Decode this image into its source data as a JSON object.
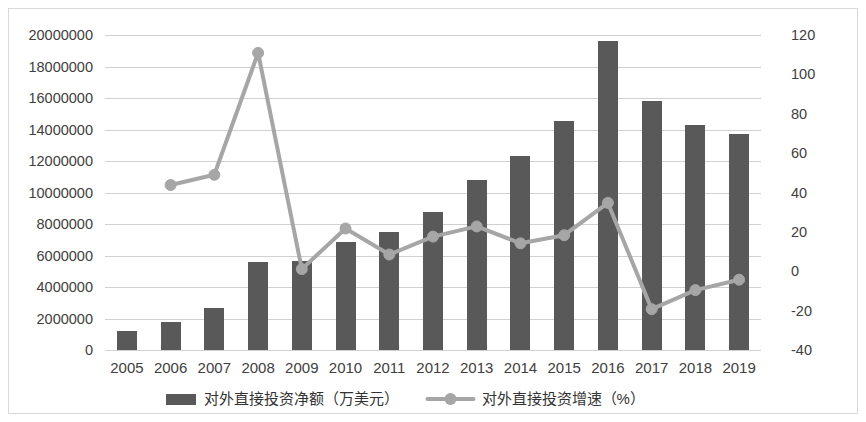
{
  "chart_data": {
    "type": "bar",
    "title": "",
    "subtitle": "",
    "xlabel": "",
    "ylabel": "",
    "grid": true,
    "legend_position": "bottom",
    "categories": [
      "2005",
      "2006",
      "2007",
      "2008",
      "2009",
      "2010",
      "2011",
      "2012",
      "2013",
      "2014",
      "2015",
      "2016",
      "2017",
      "2018",
      "2019"
    ],
    "axes": {
      "left": {
        "label": "",
        "min": 0,
        "max": 20000000,
        "step": 2000000,
        "ticks": [
          "0",
          "2000000",
          "4000000",
          "6000000",
          "8000000",
          "10000000",
          "12000000",
          "14000000",
          "16000000",
          "18000000",
          "20000000"
        ],
        "tick_values": [
          0,
          2000000,
          4000000,
          6000000,
          8000000,
          10000000,
          12000000,
          14000000,
          16000000,
          18000000,
          20000000
        ]
      },
      "right": {
        "label": "",
        "min": -40,
        "max": 120,
        "step": 20,
        "ticks": [
          "-40",
          "-20",
          "0",
          "20",
          "40",
          "60",
          "80",
          "100",
          "120"
        ],
        "tick_values": [
          -40,
          -20,
          0,
          20,
          40,
          60,
          80,
          100,
          120
        ]
      }
    },
    "series": [
      {
        "name": "对外直接投资净额（万美元）",
        "type": "bar",
        "axis": "left",
        "color": "#595959",
        "values": [
          1226000,
          1763000,
          2650000,
          5590000,
          5650000,
          6880000,
          7470000,
          8780000,
          10780000,
          12320000,
          14560000,
          19610000,
          15820000,
          14300000,
          13690000
        ]
      },
      {
        "name": "对外直接投资增速（%）",
        "type": "line",
        "axis": "right",
        "color": "#a6a6a6",
        "values": [
          null,
          43.8,
          49.0,
          110.9,
          1.1,
          21.7,
          8.5,
          17.6,
          22.8,
          14.2,
          18.3,
          34.7,
          -19.3,
          -9.6,
          -4.3
        ]
      }
    ],
    "legend": [
      {
        "label": "对外直接投资净额（万美元）",
        "marker": "bar-swatch",
        "color": "#595959"
      },
      {
        "label": "对外直接投资增速（%）",
        "marker": "line-marker",
        "color": "#a6a6a6"
      }
    ],
    "colors": {
      "bar": "#595959",
      "line": "#a6a6a6",
      "marker": "#a6a6a6",
      "grid": "#d0d0d0",
      "frame": "#d9d9d9",
      "text": "#404040",
      "background": "#ffffff"
    }
  }
}
